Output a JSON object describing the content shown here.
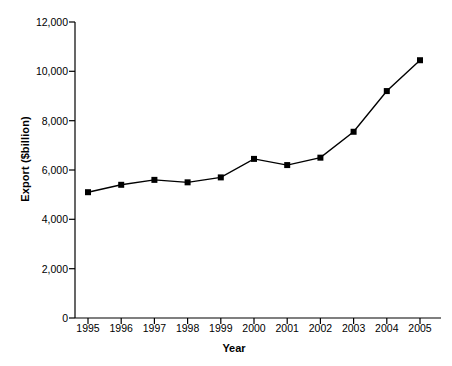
{
  "chart_data": {
    "type": "line",
    "title": "",
    "xlabel": "Year",
    "ylabel": "Export ($billion)",
    "categories": [
      "1995",
      "1996",
      "1997",
      "1998",
      "1999",
      "2000",
      "2001",
      "2002",
      "2003",
      "2004",
      "2005"
    ],
    "values": [
      5100,
      5400,
      5600,
      5500,
      5700,
      6450,
      6200,
      6500,
      7550,
      9200,
      10450
    ],
    "series": [
      {
        "name": "Export",
        "values": [
          5100,
          5400,
          5600,
          5500,
          5700,
          6450,
          6200,
          6500,
          7550,
          9200,
          10450
        ]
      }
    ],
    "ylim": [
      0,
      12000
    ],
    "ytick_values": [
      0,
      2000,
      4000,
      6000,
      8000,
      10000,
      12000
    ],
    "ytick_labels": [
      "0",
      "2,000",
      "4,000",
      "6,000",
      "8,000",
      "10,000",
      "12,000"
    ],
    "xtick_labels": [
      "1995",
      "1996",
      "1997",
      "1998",
      "1999",
      "2000",
      "2001",
      "2002",
      "2003",
      "2004",
      "2005"
    ],
    "grid": false,
    "legend": "none",
    "marker": "filled-square",
    "line_color": "#000000",
    "marker_color": "#000000",
    "background_color": "#ffffff"
  }
}
